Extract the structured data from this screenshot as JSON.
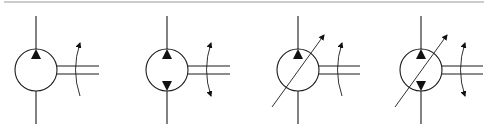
{
  "diagram": {
    "title": "",
    "colors": {
      "line": "#1a1a1a",
      "fill": "#111111",
      "border": "#9a9a9a",
      "background": "#ffffff"
    },
    "top_border": {
      "y": 2,
      "x1": 4,
      "x2": 484
    },
    "symbols": [
      {
        "name": "fixed-displacement-pump-unidirectional",
        "cx": 36,
        "cy": 70,
        "r": 21,
        "triangles": [
          "up"
        ],
        "variable": false,
        "shaft_end": 99,
        "arc_x": 77,
        "rotation_arrows": [
          "top"
        ]
      },
      {
        "name": "fixed-displacement-pump-bidirectional",
        "cx": 167,
        "cy": 70,
        "r": 21,
        "triangles": [
          "up",
          "down"
        ],
        "variable": false,
        "shaft_end": 230,
        "arc_x": 208,
        "rotation_arrows": [
          "top",
          "bottom"
        ]
      },
      {
        "name": "variable-displacement-pump-unidirectional",
        "cx": 298,
        "cy": 70,
        "r": 21,
        "triangles": [
          "up"
        ],
        "variable": true,
        "shaft_end": 360,
        "arc_x": 339,
        "rotation_arrows": [
          "top"
        ]
      },
      {
        "name": "variable-displacement-pump-bidirectional",
        "cx": 421,
        "cy": 70,
        "r": 21,
        "triangles": [
          "up",
          "down"
        ],
        "variable": true,
        "shaft_end": 483,
        "arc_x": 462,
        "rotation_arrows": [
          "top",
          "bottom"
        ]
      }
    ]
  }
}
